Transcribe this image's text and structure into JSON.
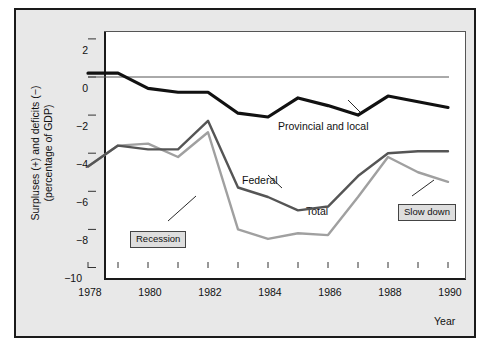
{
  "chart_data": {
    "type": "line",
    "title": "",
    "xlabel": "Year",
    "ylabel": "Surpluses (+) and deficits (−) (percentage of GDP)",
    "ylabel_line1": "Surpluses (+) and deficits (−)",
    "ylabel_line2": "(percentage of GDP)",
    "x": [
      1978,
      1979,
      1980,
      1981,
      1982,
      1983,
      1984,
      1985,
      1986,
      1987,
      1988,
      1989,
      1990
    ],
    "xlim": [
      1978,
      1990
    ],
    "ylim": [
      -10,
      3
    ],
    "yticks": [
      2,
      0,
      -2,
      -4,
      -6,
      -8,
      -10
    ],
    "ytick_labels": [
      "2",
      "0",
      "−2",
      "−4",
      "−6",
      "−8",
      "−10"
    ],
    "xticks": [
      1978,
      1979,
      1980,
      1981,
      1982,
      1983,
      1984,
      1985,
      1986,
      1987,
      1988,
      1989,
      1990
    ],
    "xtick_labels": [
      "1978",
      "1980",
      "1982",
      "1984",
      "1986",
      "1988",
      "1990"
    ],
    "xtick_labeled_values": [
      1978,
      1980,
      1982,
      1984,
      1986,
      1988,
      1990
    ],
    "grid": false,
    "legend_position": "inline-annotations",
    "zero_line": true,
    "series": [
      {
        "name": "Provincial and local",
        "color": "#111111",
        "width": 3.2,
        "values": [
          0.2,
          0.2,
          -0.6,
          -0.8,
          -0.8,
          -1.9,
          -2.1,
          -1.1,
          -1.5,
          -2.0,
          -1.0,
          -1.3,
          -1.6
        ]
      },
      {
        "name": "Federal",
        "color": "#555555",
        "width": 2.4,
        "values": [
          -4.7,
          -3.6,
          -3.8,
          -3.8,
          -2.3,
          -5.8,
          -6.3,
          -7.0,
          -6.8,
          -5.2,
          -4.0,
          -3.9,
          -3.9
        ]
      },
      {
        "name": "Total",
        "color": "#a0a0a0",
        "width": 2.4,
        "values": [
          -4.7,
          -3.6,
          -3.5,
          -4.2,
          -2.9,
          -8.0,
          -8.5,
          -8.2,
          -8.3,
          -6.3,
          -4.2,
          -5.0,
          -5.5
        ]
      }
    ],
    "annotations": [
      {
        "label": "Recession",
        "target_series": "Total",
        "target_year": 1983
      },
      {
        "label": "Slow down",
        "target_series": "Total",
        "target_year": 1990
      }
    ],
    "series_labels": [
      {
        "label": "Provincial and local"
      },
      {
        "label": "Federal"
      },
      {
        "label": "Total"
      }
    ]
  }
}
